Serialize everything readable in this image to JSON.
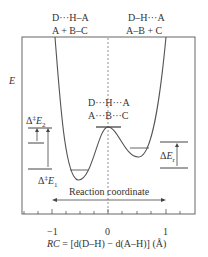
{
  "diagram": {
    "y_axis_label": "E",
    "labels": {
      "reactant_top": "D···H–A",
      "reactant_bottom": "A + B–C",
      "product_top": "D–H···A",
      "product_bottom": "A–B + C",
      "ts_top": "D···H···A",
      "ts_bottom": "A···B···C"
    },
    "annotations": {
      "barrier2": {
        "delta": "Δ",
        "dagger": "‡",
        "E": "E",
        "sub": "2"
      },
      "barrier1": {
        "delta": "Δ",
        "dagger": "‡",
        "E": "E",
        "sub": "1"
      },
      "reaction_energy": {
        "delta": "Δ",
        "E": "E",
        "sub": "r"
      }
    },
    "reaction_coordinate_label": "Reaction coordinate",
    "x_ticks": [
      "−1",
      "0",
      "1"
    ],
    "x_axis_label": {
      "prefix": "RC",
      "formula": " = [d(D–H) − d(A–H)] (Å)"
    },
    "colors": {
      "line": "#555555",
      "frame": "#666666",
      "dashed": "#777777"
    }
  }
}
